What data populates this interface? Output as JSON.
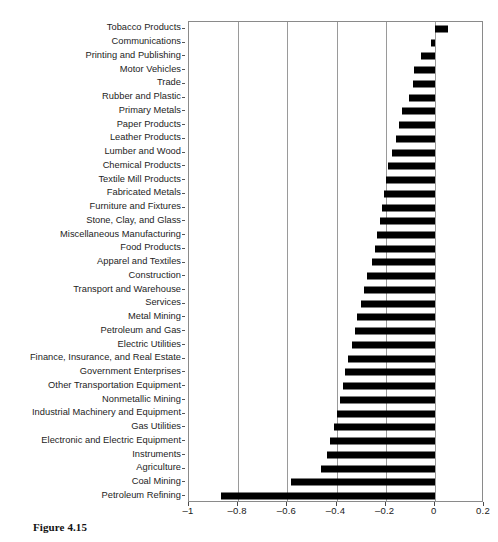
{
  "caption": "Figure 4.15",
  "chart_data": {
    "type": "bar",
    "orientation": "horizontal",
    "title": "",
    "xlabel": "",
    "ylabel": "",
    "xlim": [
      -1,
      0.2
    ],
    "ylim": null,
    "grid": "vertical gridlines at each x tick",
    "legend": "none",
    "xticks": [
      -1,
      -0.8,
      -0.6,
      -0.4,
      -0.2,
      0,
      0.2
    ],
    "xtick_labels": [
      "–1",
      "–0.8",
      "–0.6",
      "–0.4",
      "–0.2",
      "0",
      "0.2"
    ],
    "bar_color": "#000000",
    "categories": [
      "Tobacco Products",
      "Communications",
      "Printing and Publishing",
      "Motor Vehicles",
      "Trade",
      "Rubber and Plastic",
      "Primary Metals",
      "Paper Products",
      "Leather Products",
      "Lumber and Wood",
      "Chemical Products",
      "Textile Mill Products",
      "Fabricated Metals",
      "Furniture and Fixtures",
      "Stone, Clay, and Glass",
      "Miscellaneous Manufacturing",
      "Food Products",
      "Apparel and Textiles",
      "Construction",
      "Transport and Warehouse",
      "Services",
      "Metal Mining",
      "Petroleum and Gas",
      "Electric Utilities",
      "Finance, Insurance, and Real Estate",
      "Government Enterprises",
      "Other Transportation Equipment",
      "Nonmetallic Mining",
      "Industrial Machinery and Equipment",
      "Gas Utilities",
      "Electronic and Electric Equipment",
      "Instruments",
      "Agriculture",
      "Coal Mining",
      "Petroleum Refining"
    ],
    "values": [
      0.055,
      -0.015,
      -0.055,
      -0.085,
      -0.09,
      -0.105,
      -0.135,
      -0.145,
      -0.16,
      -0.175,
      -0.19,
      -0.2,
      -0.205,
      -0.215,
      -0.225,
      -0.235,
      -0.245,
      -0.255,
      -0.275,
      -0.29,
      -0.3,
      -0.315,
      -0.325,
      -0.335,
      -0.355,
      -0.365,
      -0.375,
      -0.385,
      -0.4,
      -0.41,
      -0.425,
      -0.44,
      -0.465,
      -0.585,
      -0.87
    ]
  }
}
